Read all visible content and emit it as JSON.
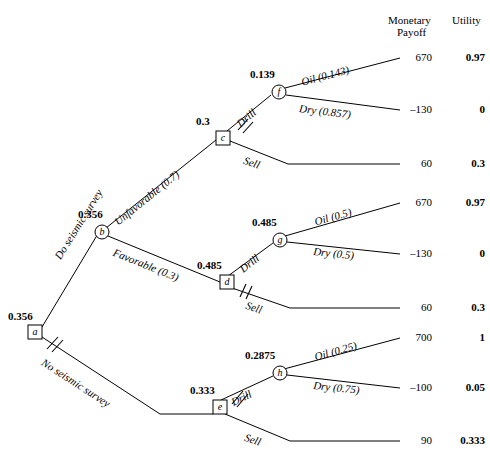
{
  "columns": {
    "payoff_header_line1": "Monetary",
    "payoff_header_line2": "Payoff",
    "utility_header": "Utility"
  },
  "nodes": [
    {
      "id": "a",
      "letter": "a",
      "type": "decision",
      "ev": "0.356",
      "x": 28,
      "y": 325
    },
    {
      "id": "b",
      "letter": "b",
      "type": "chance",
      "ev": "0.356",
      "x": 95,
      "y": 225
    },
    {
      "id": "c",
      "letter": "c",
      "type": "decision",
      "ev": "0.3",
      "x": 216,
      "y": 131
    },
    {
      "id": "d",
      "letter": "d",
      "type": "decision",
      "ev": "0.485",
      "x": 220,
      "y": 275
    },
    {
      "id": "e",
      "letter": "e",
      "type": "decision",
      "ev": "0.333",
      "x": 213,
      "y": 400
    },
    {
      "id": "f",
      "letter": "f",
      "type": "chance",
      "ev": "0.139",
      "x": 272,
      "y": 85
    },
    {
      "id": "g",
      "letter": "g",
      "type": "chance",
      "ev": "0.485",
      "x": 273,
      "y": 233
    },
    {
      "id": "h",
      "letter": "h",
      "type": "chance",
      "ev": "0.2875",
      "x": 273,
      "y": 366
    }
  ],
  "branches": [
    {
      "id": "a-b",
      "label": "Do seismic survey",
      "pruned": false
    },
    {
      "id": "a-e",
      "label": "No seismic survey",
      "pruned": true
    },
    {
      "id": "b-c",
      "label": "Unfavorable (0.7)",
      "pruned": false
    },
    {
      "id": "b-d",
      "label": "Favorable (0.3)",
      "pruned": false
    },
    {
      "id": "c-f",
      "label": "Drill",
      "pruned": true
    },
    {
      "id": "c-sell",
      "label": "Sell",
      "pruned": false
    },
    {
      "id": "d-g",
      "label": "Drill",
      "pruned": false
    },
    {
      "id": "d-sell",
      "label": "Sell",
      "pruned": true
    },
    {
      "id": "e-h",
      "label": "Drill",
      "pruned": true
    },
    {
      "id": "e-sell",
      "label": "Sell",
      "pruned": false
    },
    {
      "id": "f-oil",
      "label": "Oil (0.143)",
      "pruned": false
    },
    {
      "id": "f-dry",
      "label": "Dry (0.857)",
      "pruned": false
    },
    {
      "id": "g-oil",
      "label": "Oil (0.5)",
      "pruned": false
    },
    {
      "id": "g-dry",
      "label": "Dry (0.5)",
      "pruned": false
    },
    {
      "id": "h-oil",
      "label": "Oil (0.25)",
      "pruned": false
    },
    {
      "id": "h-dry",
      "label": "Dry (0.75)",
      "pruned": false
    }
  ],
  "outcomes": [
    {
      "id": "o1",
      "from": "f-oil",
      "payoff": "670",
      "utility": "0.97",
      "y": 58
    },
    {
      "id": "o2",
      "from": "f-dry",
      "payoff": "–130",
      "utility": "0",
      "y": 110
    },
    {
      "id": "o3",
      "from": "c-sell",
      "payoff": "60",
      "utility": "0.3",
      "y": 164
    },
    {
      "id": "o4",
      "from": "g-oil",
      "payoff": "670",
      "utility": "0.97",
      "y": 203
    },
    {
      "id": "o5",
      "from": "g-dry",
      "payoff": "–130",
      "utility": "0",
      "y": 254
    },
    {
      "id": "o6",
      "from": "d-sell",
      "payoff": "60",
      "utility": "0.3",
      "y": 308
    },
    {
      "id": "o7",
      "from": "h-oil",
      "payoff": "700",
      "utility": "1",
      "y": 338
    },
    {
      "id": "o8",
      "from": "h-dry",
      "payoff": "–100",
      "utility": "0.05",
      "y": 388
    },
    {
      "id": "o9",
      "from": "e-sell",
      "payoff": "90",
      "utility": "0.333",
      "y": 441
    }
  ],
  "colors": {
    "line": "#000000",
    "text": "#000000",
    "background": "#ffffff"
  }
}
